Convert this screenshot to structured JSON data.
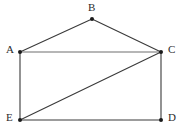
{
  "figure": {
    "background_color": "#ffffff",
    "canvas": {
      "width": 185,
      "height": 131
    },
    "style": {
      "edge_color": "#3a3a3a",
      "edge_color_light": "#6e6e6e",
      "vertex_color": "#1a1a1a",
      "label_color": "#2b2b2b",
      "edge_width": 1.1,
      "vertex_radius": 2.0
    },
    "vertices": [
      {
        "id": "A",
        "label": "A",
        "x": 20,
        "y": 52,
        "label_x": 6,
        "label_y": 44,
        "label_anchor": "left"
      },
      {
        "id": "B",
        "label": "B",
        "x": 92,
        "y": 19,
        "label_x": 88,
        "label_y": 2,
        "label_anchor": "above"
      },
      {
        "id": "C",
        "label": "C",
        "x": 161,
        "y": 52,
        "label_x": 168,
        "label_y": 44,
        "label_anchor": "right"
      },
      {
        "id": "D",
        "label": "D",
        "x": 161,
        "y": 120,
        "label_x": 168,
        "label_y": 112,
        "label_anchor": "right"
      },
      {
        "id": "E",
        "label": "E",
        "x": 20,
        "y": 120,
        "label_x": 6,
        "label_y": 112,
        "label_anchor": "left"
      }
    ],
    "edges": [
      {
        "id": "AB",
        "from": "A",
        "to": "B",
        "x1": 20,
        "y1": 52,
        "x2": 92,
        "y2": 19,
        "shade": "dark"
      },
      {
        "id": "BC",
        "from": "B",
        "to": "C",
        "x1": 92,
        "y1": 19,
        "x2": 161,
        "y2": 52,
        "shade": "dark"
      },
      {
        "id": "AC",
        "from": "A",
        "to": "C",
        "x1": 20,
        "y1": 52,
        "x2": 161,
        "y2": 52,
        "shade": "light"
      },
      {
        "id": "AE",
        "from": "A",
        "to": "E",
        "x1": 20,
        "y1": 52,
        "x2": 20,
        "y2": 120,
        "shade": "dark"
      },
      {
        "id": "ED",
        "from": "E",
        "to": "D",
        "x1": 20,
        "y1": 120,
        "x2": 161,
        "y2": 120,
        "shade": "dark"
      },
      {
        "id": "CD",
        "from": "C",
        "to": "D",
        "x1": 161,
        "y1": 52,
        "x2": 161,
        "y2": 120,
        "shade": "dark"
      },
      {
        "id": "EC",
        "from": "E",
        "to": "C",
        "x1": 20,
        "y1": 120,
        "x2": 161,
        "y2": 52,
        "shade": "dark"
      }
    ]
  }
}
